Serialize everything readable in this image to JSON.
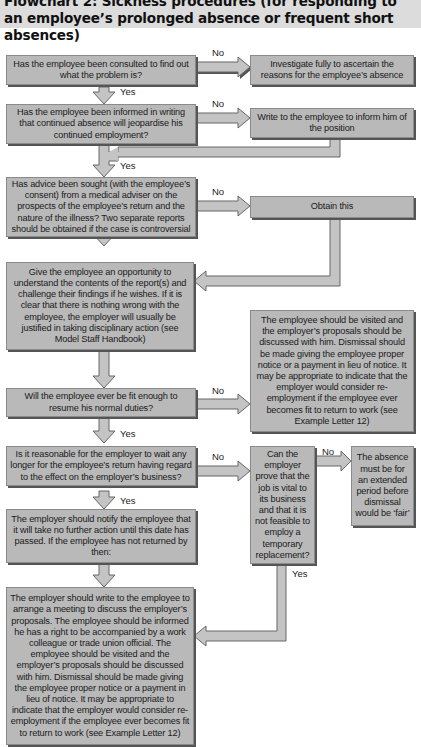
{
  "title": "Flowchart 2: Sickness procedures (for responding to\nan employee’s prolonged absence or frequent short absences)",
  "colors": {
    "box_fill": "#b9b9b9",
    "box_shadow": "#555555",
    "arrow_fill": "#c4c4c4",
    "arrow_stroke": "#666666",
    "title_band": "#dcdcdc"
  },
  "nodes": {
    "q_consulted": "Has the employee been consulted to find out what the problem is?",
    "a_investigate": "Investigate fully to ascertain the reasons for the employee’s absence",
    "q_informed": "Has the employee been informed in writing that continued absence will jeopardise his continued employment?",
    "a_write": "Write to the employee to inform him of the position",
    "q_advice": "Has advice been sought (with the employee’s consent) from a medical adviser on the prospects of the employee’s return and the nature of the illness? Two separate reports should be obtained if the case is controversial",
    "a_obtain": "Obtain this",
    "a_opportunity": "Give the employee an opportunity to understand the contents of the report(s) and challenge their findings if he wishes. If it is clear that there is nothing wrong with the employee, the employer will usually be justified in taking disciplinary action (see Model Staff Handbook)",
    "a_visit": "The employee should be visited and the employer’s proposals should be discussed with him. Dismissal should be made giving the employee proper notice or a payment in lieu of notice. It may be appropriate to indicate that the employer would consider re-employment if the employee ever becomes fit to return to work (see Example Letter 12)",
    "q_fit": "Will the employee ever be fit enough to resume his normal duties?",
    "q_wait": "Is it reasonable for the employer to wait any longer for the employee’s return having regard to the effect on the employer’s business?",
    "q_vital": "Can the employer prove that the job is vital to its business and that it is not feasible to employ a temporary replacement?",
    "a_extended": "The absence must be for an extended period before dismissal would be ‘fair’",
    "a_notify": "The employer should notify the employee that it will take no further action until this date has passed. If the employee has not returned by then:",
    "a_meeting": "The employer should write to the employee to arrange a meeting to discuss the employer’s proposals. The employee should be informed he has a right to be accompanied by a work colleague or trade union official. The employee should be visited and the employer’s proposals should be discussed with him. Dismissal should be made giving the employee proper notice or a payment in lieu of notice. It may be appropriate to indicate that the employer would consider re-employment if the employee ever becomes fit to return to work (see Example Letter 12)"
  },
  "labels": {
    "no": "No",
    "yes": "Yes"
  }
}
